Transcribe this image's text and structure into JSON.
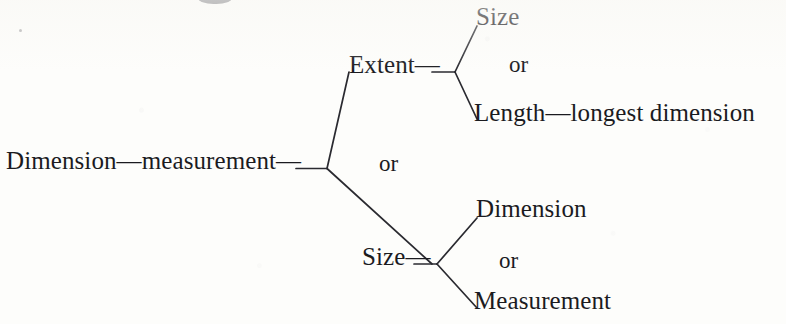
{
  "diagram": {
    "type": "tree",
    "orientation": "left-to-right",
    "title": "",
    "root": {
      "id": "root",
      "label": "Dimension—measurement—"
    },
    "separators": {
      "root_or": "or",
      "extent_or": "or",
      "size_or": "or"
    },
    "branches": [
      {
        "id": "extent",
        "label": "Extent—",
        "leaves": [
          {
            "id": "leaf-size",
            "label": "Size"
          },
          {
            "id": "leaf-length",
            "label": "Length—longest dimension"
          }
        ]
      },
      {
        "id": "size",
        "label": "Size—",
        "leaves": [
          {
            "id": "leaf-dimension",
            "label": "Dimension"
          },
          {
            "id": "leaf-measurement",
            "label": "Measurement"
          }
        ]
      }
    ],
    "colors": {
      "ink": "#1b1b1f",
      "line": "#2a2a30",
      "page": "#fdfdfb"
    }
  }
}
